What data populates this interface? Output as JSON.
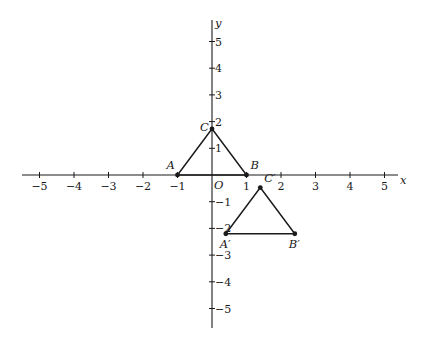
{
  "axes": {
    "x_label": "x",
    "y_label": "y",
    "origin_label": "O",
    "x_range": [
      -5.5,
      5.5
    ],
    "y_range": [
      -5.7,
      5.8
    ],
    "x_ticks": [
      {
        "value": -5,
        "label": "−5"
      },
      {
        "value": -4,
        "label": "−4"
      },
      {
        "value": -3,
        "label": "−3"
      },
      {
        "value": -2,
        "label": "−2"
      },
      {
        "value": -1,
        "label": "−1"
      },
      {
        "value": 1,
        "label": "1"
      },
      {
        "value": 2,
        "label": "2"
      },
      {
        "value": 3,
        "label": "3"
      },
      {
        "value": 4,
        "label": "4"
      },
      {
        "value": 5,
        "label": "5"
      }
    ],
    "y_ticks": [
      {
        "value": 5,
        "label": "5"
      },
      {
        "value": 4,
        "label": "4"
      },
      {
        "value": 3,
        "label": "3"
      },
      {
        "value": 2,
        "label": "2"
      },
      {
        "value": 1,
        "label": "1"
      },
      {
        "value": -1,
        "label": "−1"
      },
      {
        "value": -2,
        "label": "−2"
      },
      {
        "value": -3,
        "label": "−3"
      },
      {
        "value": -4,
        "label": "−4"
      },
      {
        "value": -5,
        "label": "−5"
      }
    ]
  },
  "triangles": [
    {
      "name": "original",
      "vertices": [
        {
          "label": "A",
          "x": -1,
          "y": 0,
          "anchor": "upper-left"
        },
        {
          "label": "B",
          "x": 1,
          "y": 0,
          "anchor": "upper-right"
        },
        {
          "label": "C",
          "x": 0,
          "y": 1.73,
          "anchor": "left"
        }
      ]
    },
    {
      "name": "image",
      "vertices": [
        {
          "label": "A′",
          "x": 0.4,
          "y": -2.2,
          "anchor": "below"
        },
        {
          "label": "B′",
          "x": 2.4,
          "y": -2.2,
          "anchor": "below"
        },
        {
          "label": "C′",
          "x": 1.4,
          "y": -0.47,
          "anchor": "upper-right"
        }
      ]
    }
  ]
}
